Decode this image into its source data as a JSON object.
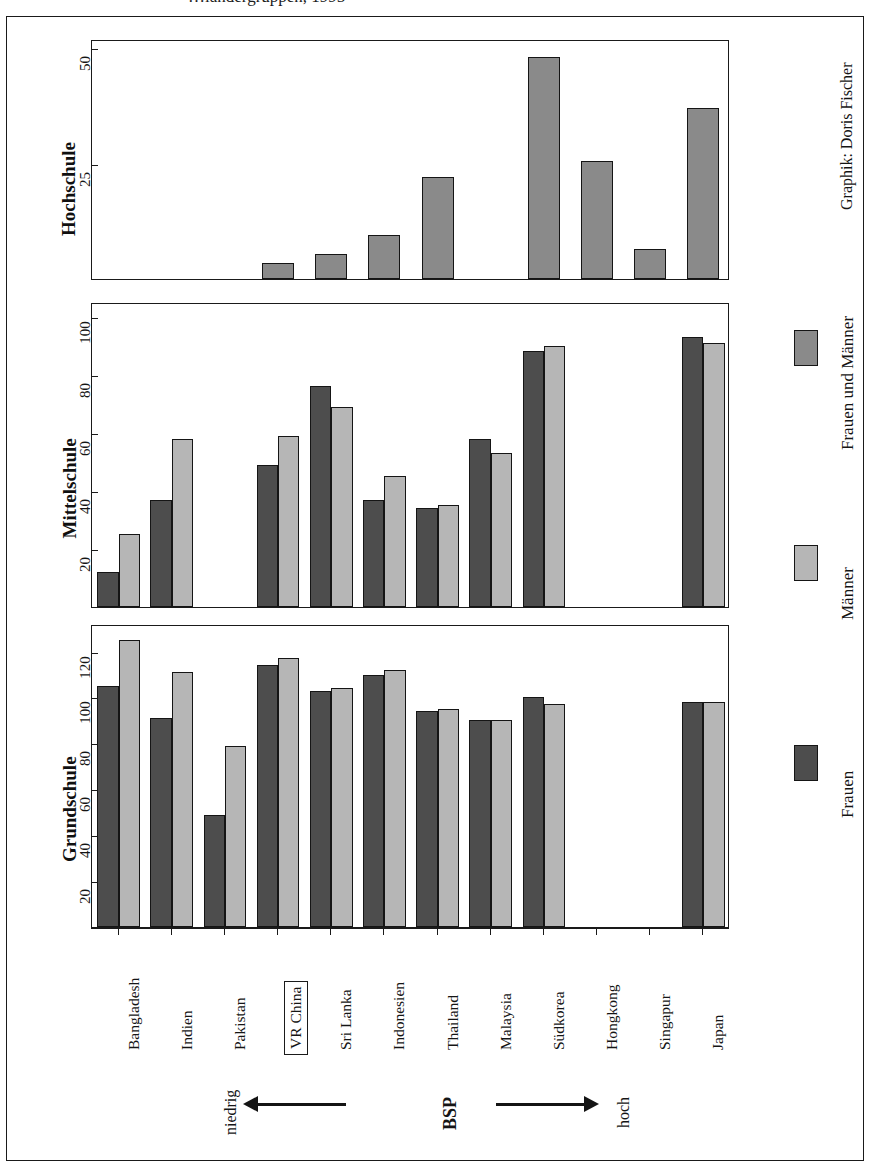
{
  "title": {
    "text": "…ländergruppen, 1995",
    "note": "clipped at top edge of scan"
  },
  "credit": "Graphik: Doris Fischer",
  "legend": {
    "items": [
      {
        "label": "Frauen und Männer",
        "color": "#8a8a8a",
        "swatch": "frauen-und-maenner-swatch"
      },
      {
        "label": "Männer",
        "color": "#b6b6b6",
        "swatch": "maenner-swatch"
      },
      {
        "label": "Frauen",
        "color": "#4d4d4d",
        "swatch": "frauen-swatch"
      }
    ]
  },
  "axis_annotation": {
    "left_label": "niedrig",
    "center_label": "BSP",
    "right_label": "hoch",
    "left_arrow": "arrow-left",
    "right_arrow": "arrow-right"
  },
  "countries": [
    "Bangladesh",
    "Indien",
    "Pakistan",
    "VR China",
    "Sri Lanka",
    "Indonesien",
    "Thailand",
    "Malaysia",
    "Südkorea",
    "Hongkong",
    "Singapur",
    "Japan"
  ],
  "highlighted_country": "VR China",
  "panels": [
    {
      "name": "Hochschule",
      "ticks": [
        25,
        50
      ],
      "ymax": 52,
      "series_shown": [
        "Frauen und Männer"
      ]
    },
    {
      "name": "Mittelschule",
      "ticks": [
        20,
        40,
        60,
        80,
        100
      ],
      "ymax": 105,
      "series_shown": [
        "Frauen",
        "Männer"
      ]
    },
    {
      "name": "Grundschule",
      "ticks": [
        20,
        40,
        60,
        80,
        100,
        120
      ],
      "ymax": 132,
      "series_shown": [
        "Frauen",
        "Männer"
      ]
    }
  ],
  "chart_data": [
    {
      "type": "bar",
      "title": "Hochschule",
      "xlabel": "",
      "ylabel": "Hochschule",
      "ylim": [
        0,
        52
      ],
      "ticks": [
        25,
        50
      ],
      "grid": false,
      "categories": [
        "Bangladesh",
        "Indien",
        "Pakistan",
        "VR China",
        "Sri Lanka",
        "Indonesien",
        "Thailand",
        "Malaysia",
        "Südkorea",
        "Hongkong",
        "Singapur",
        "Japan"
      ],
      "series": [
        {
          "name": "Frauen und Männer",
          "color": "#8a8a8a",
          "values": [
            null,
            null,
            null,
            3.5,
            5.5,
            9.5,
            22,
            null,
            48,
            25.5,
            6.5,
            37
          ]
        }
      ]
    },
    {
      "type": "bar",
      "title": "Mittelschule",
      "xlabel": "",
      "ylabel": "Mittelschule",
      "ylim": [
        0,
        105
      ],
      "ticks": [
        20,
        40,
        60,
        80,
        100
      ],
      "grid": false,
      "categories": [
        "Bangladesh",
        "Indien",
        "Pakistan",
        "VR China",
        "Sri Lanka",
        "Indonesien",
        "Thailand",
        "Malaysia",
        "Südkorea",
        "Hongkong",
        "Singapur",
        "Japan"
      ],
      "series": [
        {
          "name": "Frauen",
          "color": "#4d4d4d",
          "values": [
            12,
            37,
            null,
            49,
            76,
            37,
            34,
            58,
            88,
            null,
            null,
            93
          ]
        },
        {
          "name": "Männer",
          "color": "#b6b6b6",
          "values": [
            25,
            58,
            null,
            59,
            69,
            45,
            35,
            53,
            90,
            null,
            null,
            91
          ]
        }
      ]
    },
    {
      "type": "bar",
      "title": "Grundschule",
      "xlabel": "",
      "ylabel": "Grundschule",
      "ylim": [
        0,
        132
      ],
      "ticks": [
        20,
        40,
        60,
        80,
        100,
        120
      ],
      "grid": false,
      "categories": [
        "Bangladesh",
        "Indien",
        "Pakistan",
        "VR China",
        "Sri Lanka",
        "Indonesien",
        "Thailand",
        "Malaysia",
        "Südkorea",
        "Hongkong",
        "Singapur",
        "Japan"
      ],
      "series": [
        {
          "name": "Frauen",
          "color": "#4d4d4d",
          "values": [
            105,
            91,
            49,
            114,
            103,
            110,
            94,
            90,
            100,
            null,
            null,
            98
          ]
        },
        {
          "name": "Männer",
          "color": "#b6b6b6",
          "values": [
            125,
            111,
            79,
            117,
            104,
            112,
            95,
            90,
            97,
            null,
            null,
            98
          ]
        }
      ]
    }
  ]
}
